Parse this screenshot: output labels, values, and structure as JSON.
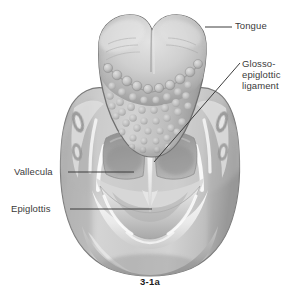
{
  "figure": {
    "caption": "3-1a",
    "background_color": "#ffffff",
    "text_color": "#3a3a3a",
    "caption_color": "#1c1c1c",
    "leader_line_color": "#3d3d3d"
  },
  "labels": {
    "tongue": {
      "text": "Tongue",
      "leader": "horizontal-short"
    },
    "glossoepiglottic_ligament": {
      "line1": "Glosso-",
      "line2": "epiglottic",
      "line3": "ligament",
      "leader": "diagonal-long"
    },
    "vallecula": {
      "text": "Vallecula",
      "leader": "horizontal-long"
    },
    "epiglottis": {
      "text": "Epiglottis",
      "leader": "horizontal-long"
    }
  },
  "illustration": {
    "subject": "base of tongue, valleculae and epiglottis, superior view",
    "style": "grayscale medical airbrush rendering",
    "tones": {
      "outline": "#6f6f6f",
      "body_light": "#d8d8d8",
      "body_mid": "#b6b6b6",
      "body_dark": "#9a9a9a",
      "shadow": "#808080",
      "deep_shadow": "#6d6d6d",
      "highlight": "#f2f2f2",
      "papilla_light": "#cfcfcf",
      "papilla_shadow": "#9d9d9d"
    },
    "structures": [
      "tongue-base",
      "circumvallate-papillae",
      "lingual-tonsil",
      "median-glossoepiglottic-fold",
      "left-vallecula",
      "right-vallecula",
      "epiglottis",
      "pharyngeal-wall"
    ]
  }
}
